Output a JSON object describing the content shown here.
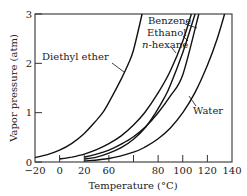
{
  "chart_data": {
    "type": "line",
    "title": "",
    "xlabel": "Temperature (°C)",
    "ylabel": "Vapor pressure (atm)",
    "xlim": [
      -20,
      140
    ],
    "ylim": [
      0,
      3
    ],
    "grid": false,
    "legend": "inline labels with leader lines",
    "x_tick_labels": [
      "−20",
      "0",
      "20",
      "60",
      "80",
      "100",
      "120",
      "140"
    ],
    "x_tick_values": [
      -20,
      0,
      20,
      40,
      60,
      80,
      100,
      120,
      140
    ],
    "x_tick_note": "The label printed at the 40 °C tick position reads '60' in the image; the 60 °C position has no separate label.",
    "y_tick_labels": [
      "0",
      "1",
      "2",
      "3"
    ],
    "y_tick_values": [
      0,
      1,
      2,
      3
    ],
    "series": [
      {
        "name": "Diethyl ether",
        "x": [
          -20,
          -10,
          0,
          10,
          20,
          30,
          35,
          40,
          50,
          56,
          60,
          67
        ],
        "y": [
          0.09,
          0.15,
          0.24,
          0.38,
          0.58,
          0.85,
          1.0,
          1.21,
          1.68,
          2.0,
          2.27,
          3.0
        ]
      },
      {
        "name": "n-hexane",
        "x": [
          0,
          10,
          20,
          30,
          40,
          50,
          60,
          69,
          80,
          90,
          100,
          107
        ],
        "y": [
          0.06,
          0.1,
          0.16,
          0.25,
          0.37,
          0.53,
          0.75,
          1.0,
          1.4,
          1.85,
          2.45,
          3.0
        ]
      },
      {
        "name": "Ethanol",
        "x": [
          20,
          30,
          40,
          50,
          60,
          70,
          78,
          85,
          90,
          100,
          110
        ],
        "y": [
          0.06,
          0.1,
          0.18,
          0.29,
          0.46,
          0.71,
          1.0,
          1.3,
          1.56,
          2.22,
          3.0
        ]
      },
      {
        "name": "Benzene",
        "x": [
          20,
          30,
          40,
          50,
          60,
          70,
          80,
          90,
          100,
          113
        ],
        "y": [
          0.1,
          0.16,
          0.24,
          0.36,
          0.51,
          0.72,
          1.0,
          1.34,
          1.77,
          3.0
        ]
      },
      {
        "name": "Water",
        "x": [
          20,
          40,
          60,
          70,
          80,
          90,
          100,
          110,
          120,
          128,
          134
        ],
        "y": [
          0.02,
          0.07,
          0.2,
          0.31,
          0.47,
          0.69,
          1.0,
          1.41,
          1.96,
          2.5,
          3.0
        ]
      }
    ]
  }
}
